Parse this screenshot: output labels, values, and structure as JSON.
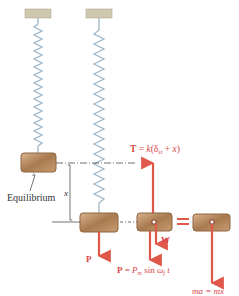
{
  "diagram": {
    "type": "spring-mass forced vibration free-body diagram",
    "labels": {
      "equilibrium": "Equilibrium",
      "displacement": "x",
      "applied_force": "P",
      "tension": "T = k(δst + x)",
      "tension_parts": {
        "prefix": "T = k(δ",
        "sub": "st",
        "suffix": " + x)"
      },
      "weight": "W",
      "forcing": "P = Pm sin ωf t",
      "forcing_parts": {
        "prefix": "P = P",
        "sub1": "m",
        "mid": " sin ω",
        "sub2": "f",
        "suffix": "t"
      },
      "equals": "=",
      "inertia": "ma = mẍ"
    },
    "colors": {
      "force_arrow": "#e0584a",
      "force_text": "#d9464a",
      "spring": "#9fb7c8",
      "ceiling": "#cfc7ae",
      "block_fill": "#b98a5e",
      "block_edge": "#8d6440",
      "line": "#333333"
    }
  }
}
